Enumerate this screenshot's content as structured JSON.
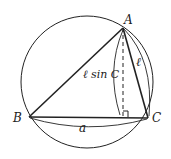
{
  "diagram": {
    "vertices": {
      "A": "A",
      "B": "B",
      "C": "C"
    },
    "labels": {
      "altitude": "ℓ sin C",
      "side_AC": "ℓ",
      "side_BC": "a"
    },
    "colors": {
      "stroke": "#222222",
      "background": "#ffffff"
    }
  }
}
